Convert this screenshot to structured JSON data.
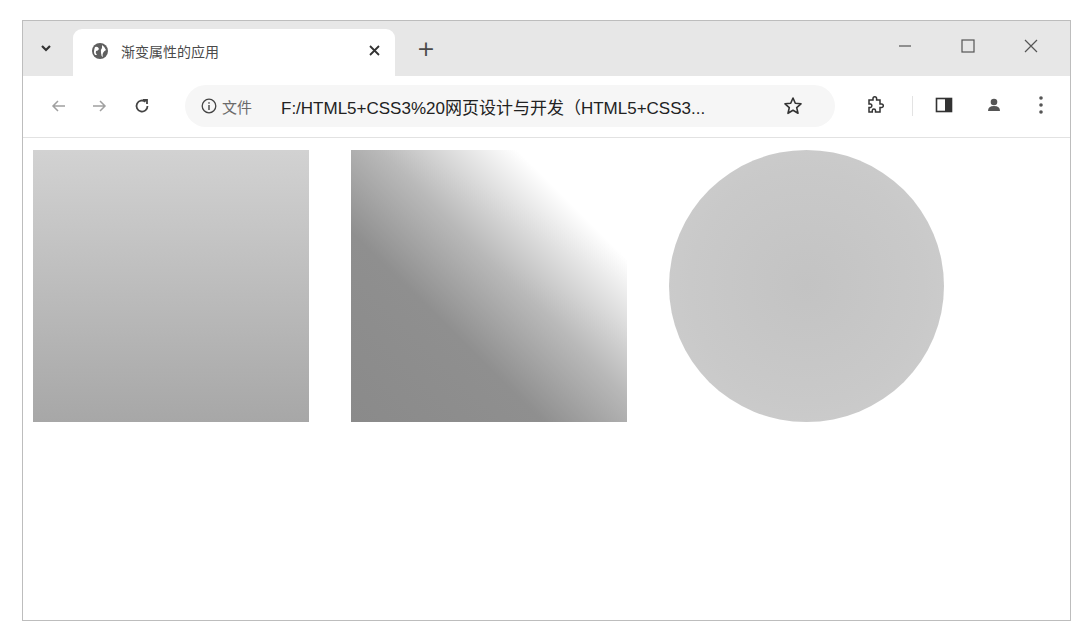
{
  "browser": {
    "tab": {
      "title": "渐变属性的应用",
      "favicon": "globe-icon",
      "close_glyph": "✕"
    },
    "new_tab_glyph": "+",
    "window_controls": {
      "minimize": "minimize-icon",
      "maximize": "maximize-icon",
      "close": "close-icon"
    },
    "toolbar": {
      "back": "back-arrow-icon",
      "forward": "forward-arrow-icon",
      "reload": "reload-icon",
      "address": {
        "security_icon": "info-icon",
        "scheme_label": "文件",
        "url": "F:/HTML5+CSS3%20网页设计与开发（HTML5+CSS3..."
      },
      "bookmark": "star-icon",
      "extensions": "puzzle-icon",
      "side_panel": "side-panel-icon",
      "profile": "profile-icon",
      "menu": "kebab-menu-icon"
    }
  },
  "page": {
    "shapes": [
      {
        "name": "linear-gradient-square",
        "type": "square",
        "gradient": "linear to bottom",
        "colors": [
          "#d2d2d2",
          "#a7a7a7"
        ]
      },
      {
        "name": "diagonal-gradient-square",
        "type": "square",
        "gradient": "linear to top right",
        "colors": [
          "#8a8a8a",
          "#ffffff"
        ]
      },
      {
        "name": "radial-gradient-circle",
        "type": "circle",
        "gradient": "radial",
        "colors": [
          "#c3c3c3",
          "#cfcfcf"
        ]
      }
    ]
  }
}
